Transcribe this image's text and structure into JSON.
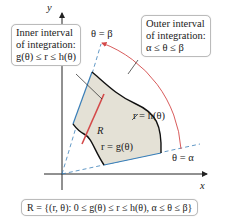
{
  "axes": {
    "x_label": "x",
    "y_label": "y"
  },
  "rays": {
    "beta_label": "θ = β",
    "alpha_label": "θ = α"
  },
  "curves": {
    "outer_label": "r = h(θ)",
    "inner_label": "r = g(θ)",
    "region_label": "R"
  },
  "callouts": {
    "inner": {
      "line1": "Inner interval",
      "line2": "of integration:",
      "line3": "g(θ) ≤ r ≤ h(θ)"
    },
    "outer": {
      "line1": "Outer interval",
      "line2": "of integration:",
      "line3": "α ≤ θ ≤ β"
    }
  },
  "definition": "R = {(r, θ): 0 ≤ g(θ) ≤ r ≤ h(θ), α ≤ θ ≤ β}",
  "colors": {
    "region_fill": "#e4e1d6",
    "ray_blue": "#3a7fb8",
    "arc_red": "#d44a4a",
    "axis": "#222222"
  }
}
